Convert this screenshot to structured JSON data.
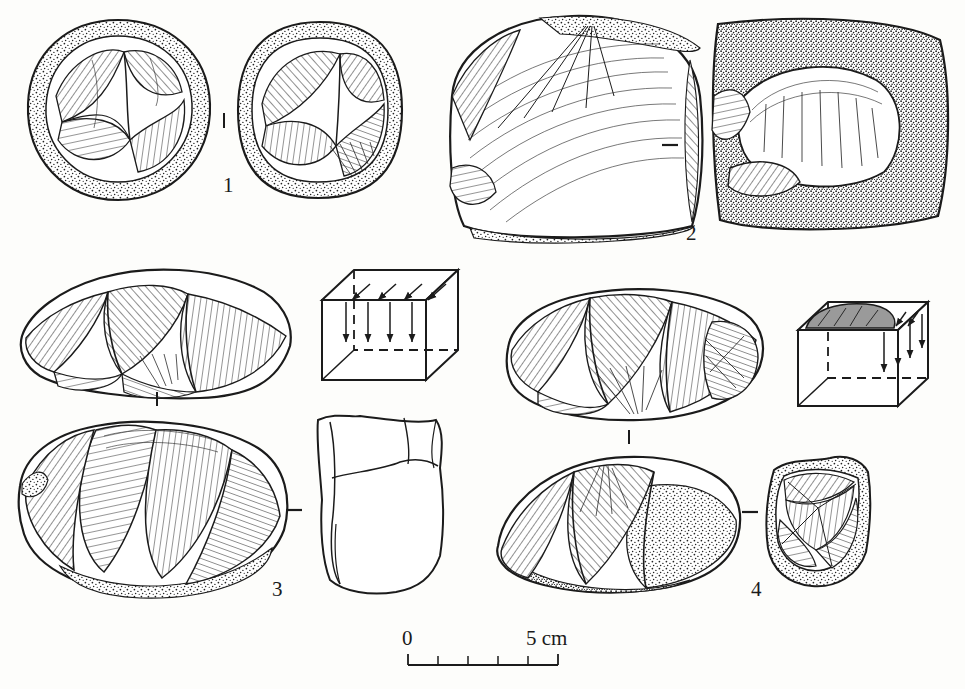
{
  "plate": {
    "kind": "archaeological-lithic-illustration",
    "description": "Line drawings of four flaked stone artefacts (cores and flakes), each rendered in two views, with two schematic reduction cubes and a metric scale bar.",
    "background_color": "#fdfdfb",
    "ink_color": "#1b1b1b",
    "width": 965,
    "height": 689
  },
  "figures": [
    {
      "id": "1",
      "label": "1",
      "label_x": 223,
      "label_y": 184,
      "separator": "vertical-tick",
      "separator_x": 224,
      "separator_y": 120,
      "views": [
        {
          "name": "core-1-view-a",
          "cx": 118,
          "cy": 110,
          "rx": 92,
          "ry": 92,
          "cortex": "stippled-rim",
          "scars": "radial-hatched"
        },
        {
          "name": "core-1-view-b",
          "cx": 320,
          "cy": 112,
          "rx": 82,
          "ry": 90,
          "cortex": "stippled-rim",
          "scars": "radial-hatched"
        }
      ]
    },
    {
      "id": "2",
      "label": "2",
      "label_x": 692,
      "label_y": 232,
      "separator": "horizontal-dash",
      "separator_x": 669,
      "separator_y": 145,
      "views": [
        {
          "name": "flake-2-view-a",
          "cx": 570,
          "cy": 128,
          "rx": 140,
          "ry": 110,
          "cortex": "stippled-edge",
          "scars": "ripple-lines-from-platform"
        },
        {
          "name": "flake-2-view-b",
          "cx": 830,
          "cy": 122,
          "rx": 118,
          "ry": 110,
          "cortex": "heavy-stipple",
          "scars": "single-large-scar"
        }
      ]
    },
    {
      "id": "3",
      "label": "3",
      "label_x": 278,
      "label_y": 588,
      "separator": "vertical-tick",
      "separator_x": 157,
      "separator_y": 398,
      "separator2": "horizontal-dash",
      "separator2_x": 293,
      "separator2_y": 510,
      "views": [
        {
          "name": "core-3-view-a",
          "cx": 152,
          "cy": 330,
          "rx": 140,
          "ry": 68,
          "cortex": "thin-rim",
          "scars": "parallel-hatched-facets"
        },
        {
          "name": "core-3-view-b",
          "cx": 152,
          "cy": 512,
          "rx": 140,
          "ry": 80,
          "cortex": "stippled-base",
          "scars": "convergent-hatched"
        },
        {
          "name": "core-3-section",
          "cx": 378,
          "cy": 508,
          "rx": 60,
          "ry": 88,
          "cortex": "none",
          "scars": "plain-outline-section"
        }
      ]
    },
    {
      "id": "4",
      "label": "4",
      "label_x": 757,
      "label_y": 588,
      "separator": "vertical-tick",
      "separator_x": 629,
      "separator_y": 438,
      "separator2": "horizontal-dash",
      "separator2_x": 750,
      "separator2_y": 512,
      "views": [
        {
          "name": "core-4-view-a",
          "cx": 632,
          "cy": 358,
          "rx": 128,
          "ry": 62,
          "cortex": "thin-rim",
          "scars": "parallel-hatched-facets"
        },
        {
          "name": "core-4-view-b",
          "cx": 620,
          "cy": 530,
          "rx": 120,
          "ry": 62,
          "cortex": "stippled-base",
          "scars": "hatched-facets"
        },
        {
          "name": "core-4-section",
          "cx": 818,
          "cy": 523,
          "rx": 52,
          "ry": 62,
          "cortex": "stippled-base",
          "scars": "convergent-star-scars"
        }
      ]
    }
  ],
  "schematics": [
    {
      "name": "reduction-cube-1",
      "x": 322,
      "y": 268,
      "width": 136,
      "height": 112,
      "top_face_arrows": 4,
      "front_face_arrows": 4,
      "top_face_shaded": false,
      "hidden_edges": "dashed",
      "meaning": "unidirectional flake removal from a single platform"
    },
    {
      "name": "reduction-cube-2",
      "x": 798,
      "y": 300,
      "width": 132,
      "height": 108,
      "top_face_arrows": 4,
      "front_face_arrows": 4,
      "top_face_shaded": true,
      "shade_color": "#9a9a9a",
      "hidden_edges": "dashed",
      "meaning": "flake removal with prepared/shaded striking surface"
    }
  ],
  "scale_bar": {
    "name": "scale-bar",
    "zero_label": "0",
    "max_label": "5 cm",
    "x_start": 408,
    "x_end": 558,
    "y_axis": 665,
    "tick_count": 6,
    "intervals": 5,
    "unit": "cm",
    "zero_label_x": 404,
    "zero_label_y": 640,
    "max_label_x": 528,
    "max_label_y": 640
  }
}
